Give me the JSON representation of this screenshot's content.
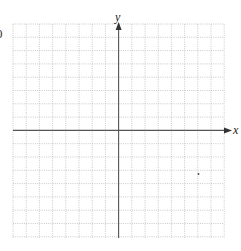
{
  "diagram": {
    "type": "coordinate-grid",
    "corner_label": "0",
    "axes": {
      "x_label": "x",
      "y_label": "y"
    },
    "grid": {
      "columns": 16,
      "rows": 16,
      "line_style": "dotted",
      "grid_color": "#b5b5b5",
      "axis_color": "#555555"
    }
  }
}
